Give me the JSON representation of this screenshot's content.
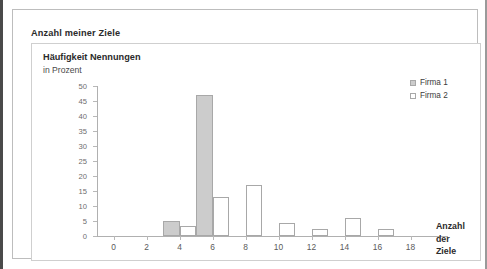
{
  "page": {
    "title": "Anzahl meiner Ziele"
  },
  "chart_data": {
    "type": "bar",
    "title": "Anzahl meiner Ziele",
    "ylabel": "Häufigkeit Nennungen",
    "ylabel_sub": "in Prozent",
    "xlabel": "Anzahl der Ziele",
    "xlabel_lines": [
      "Anzahl",
      "der",
      "Ziele"
    ],
    "grid": false,
    "legend_position": "top-right",
    "ylim": [
      0,
      50
    ],
    "ytick_step": 5,
    "yticks": [
      0,
      5,
      10,
      15,
      20,
      25,
      30,
      35,
      40,
      45,
      50
    ],
    "xlim": [
      -1,
      19
    ],
    "xtick_step": 2,
    "xticks": [
      0,
      2,
      4,
      6,
      8,
      10,
      12,
      14,
      16,
      18
    ],
    "categories": [
      0,
      1,
      2,
      3,
      4,
      5,
      6,
      7,
      8,
      9,
      10,
      11,
      12,
      13,
      14,
      15,
      16,
      17,
      18
    ],
    "series": [
      {
        "name": "Firma 1",
        "color": "#cccccc",
        "border": "#a8a8a8",
        "points": [
          {
            "x": 4,
            "value": 5
          },
          {
            "x": 6,
            "value": 47
          }
        ]
      },
      {
        "name": "Firma 2",
        "color": "#ffffff",
        "border": "#a8a8a8",
        "points": [
          {
            "x": 4,
            "value": 3.5
          },
          {
            "x": 6,
            "value": 13
          },
          {
            "x": 8,
            "value": 17
          },
          {
            "x": 10,
            "value": 4.3
          },
          {
            "x": 12,
            "value": 2.5
          },
          {
            "x": 14,
            "value": 6
          },
          {
            "x": 16,
            "value": 2.5
          }
        ]
      }
    ]
  },
  "colors": {
    "frame_dark": "#4a4a4a",
    "frame_light": "#bdbdbd",
    "panel_border": "#cfcfcf",
    "axis": "#b0b0b0",
    "firma1_fill": "#cccccc",
    "firma2_fill": "#ffffff",
    "bar_border": "#a8a8a8",
    "text": "#2b2b2b"
  }
}
